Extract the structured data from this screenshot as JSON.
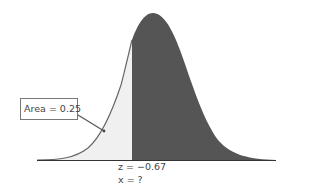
{
  "diagram": {
    "type": "normal-distribution-shaded",
    "callout": {
      "text": "Area = 0.25"
    },
    "labels": {
      "z": "z = −0.67",
      "x": "x = ?"
    },
    "colors": {
      "dark_region": "#555555",
      "light_region": "#f0f0f0",
      "curve": "#666666",
      "axis": "#333333"
    }
  }
}
